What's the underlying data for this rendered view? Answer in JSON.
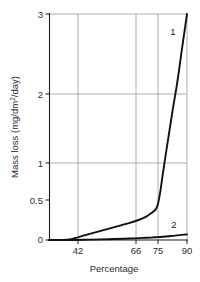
{
  "chart_data": {
    "type": "line",
    "title": "",
    "xlabel": "Percentage",
    "ylabel": "Mass loss (mg/dm2/day)",
    "ylabel_prefix": "Mass loss (mg/dm",
    "ylabel_sup": "2",
    "ylabel_suffix": "/day)",
    "xticks": [
      42,
      66,
      75,
      90
    ],
    "xtick_labels": [
      "42",
      "66",
      "75",
      "90"
    ],
    "yticks": [
      0,
      0.5,
      1,
      2,
      3
    ],
    "ytick_labels": [
      "0",
      "0.5",
      "1",
      "2",
      "3"
    ],
    "xlim": [
      33,
      90
    ],
    "ylim": [
      0,
      3
    ],
    "grid": "both",
    "grid_y_values": [
      1,
      2,
      3
    ],
    "grid_x_values": [
      42,
      66,
      75,
      90
    ],
    "legend_position": "inline-end-of-curve",
    "series": [
      {
        "name": "1",
        "label": "1",
        "x": [
          33,
          38,
          42,
          48,
          54,
          60,
          66,
          70,
          73,
          75,
          77,
          78,
          79,
          80,
          82,
          84,
          86,
          88,
          90
        ],
        "y": [
          0.0,
          0.0,
          0.01,
          0.06,
          0.11,
          0.16,
          0.21,
          0.25,
          0.29,
          0.33,
          0.38,
          0.45,
          0.62,
          0.85,
          1.3,
          1.75,
          2.15,
          2.58,
          3.0
        ]
      },
      {
        "name": "2",
        "label": "2",
        "x": [
          33,
          42,
          50,
          60,
          66,
          72,
          75,
          80,
          85,
          90
        ],
        "y": [
          0.0,
          0.0,
          0.005,
          0.012,
          0.018,
          0.026,
          0.03,
          0.04,
          0.055,
          0.07
        ]
      }
    ]
  }
}
